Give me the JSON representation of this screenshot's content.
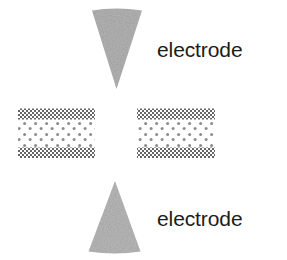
{
  "figure": {
    "width": 287,
    "height": 260,
    "background": "#ffffff"
  },
  "labels": {
    "top_electrode": "electrode",
    "bottom_electrode": "electrode",
    "text_color": "#1c1c1c"
  },
  "electrodes": [
    {
      "id": "top-electrode",
      "shape": "cone",
      "orientation": "point-down",
      "fill": "#b3b3b3",
      "base_y": 10,
      "apex_y": 89,
      "base_left_x": 92,
      "base_right_x": 142,
      "apex_x": 116
    },
    {
      "id": "bottom-electrode",
      "shape": "cone",
      "orientation": "point-up",
      "fill": "#b8b8b8",
      "base_y": 252,
      "apex_y": 181,
      "base_left_x": 88,
      "base_right_x": 141,
      "apex_x": 115
    }
  ],
  "membranes": [
    {
      "id": "left-membrane",
      "x": 18,
      "y": 108,
      "width": 77,
      "height": 50,
      "band_color": "#6e6e6e",
      "band_height": 11,
      "interior_dot_color": "#8c8c8c",
      "interior_fill": "#ffffff"
    },
    {
      "id": "right-membrane",
      "x": 137,
      "y": 108,
      "width": 78,
      "height": 50,
      "band_color": "#6e6e6e",
      "band_height": 11,
      "interior_dot_color": "#8c8c8c",
      "interior_fill": "#ffffff"
    }
  ]
}
